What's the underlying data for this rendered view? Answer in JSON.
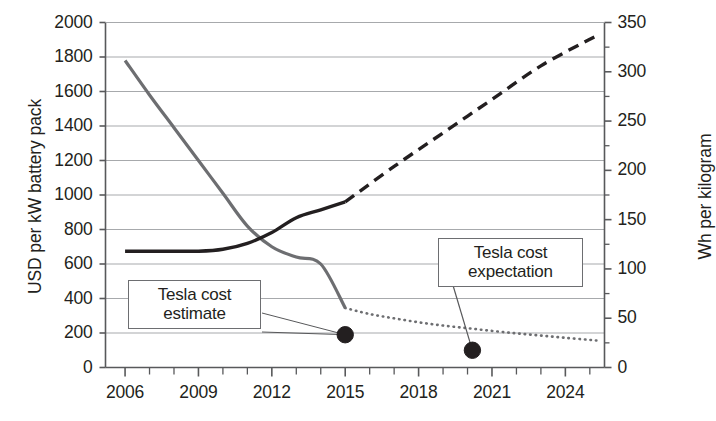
{
  "chart_data": {
    "type": "line",
    "title": "",
    "xlabel": "",
    "ylabel": "USD per kW battery pack",
    "y2label": "Wh per kilogram",
    "xlim": [
      2005.2,
      2025.6
    ],
    "ylim": [
      0,
      2000
    ],
    "y2lim": [
      0,
      350
    ],
    "grid": true,
    "legend": "none",
    "x_ticks_major": [
      2006,
      2009,
      2012,
      2015,
      2018,
      2021,
      2024
    ],
    "x_tick_labels": [
      "2006",
      "2009",
      "2012",
      "2015",
      "2018",
      "2021",
      "2024"
    ],
    "x_ticks_minor": [
      2007,
      2008,
      2010,
      2011,
      2013,
      2014,
      2016,
      2017,
      2019,
      2020,
      2022,
      2023,
      2025
    ],
    "y_ticks": [
      0,
      200,
      400,
      600,
      800,
      1000,
      1200,
      1400,
      1600,
      1800,
      2000
    ],
    "y_tick_labels": [
      "0",
      "200",
      "400",
      "600",
      "800",
      "1000",
      "1200",
      "1400",
      "1600",
      "1800",
      "2000"
    ],
    "y2_ticks": [
      0,
      50,
      100,
      150,
      200,
      250,
      300,
      350
    ],
    "y2_tick_labels": [
      "0",
      "50",
      "100",
      "150",
      "200",
      "250",
      "300",
      "350"
    ],
    "y2_ticks_minor": [
      25,
      75,
      125,
      175,
      225,
      275,
      325
    ],
    "series": [
      {
        "name": "USD per kW battery pack",
        "axis": "left",
        "color": "#6d6e71",
        "style": "solid",
        "width": 3.2,
        "x": [
          2006,
          2007,
          2008,
          2009,
          2010,
          2011,
          2012,
          2013,
          2014,
          2015
        ],
        "values": [
          1780,
          1580,
          1390,
          1200,
          1010,
          820,
          700,
          640,
          600,
          345
        ]
      },
      {
        "name": "USD per kW battery pack (projected)",
        "axis": "left",
        "color": "#6d6e71",
        "style": "dotted",
        "width": 3.0,
        "x": [
          2015,
          2016,
          2017,
          2018,
          2019,
          2020,
          2021,
          2022,
          2023,
          2024,
          2025,
          2025.4
        ],
        "values": [
          345,
          310,
          285,
          262,
          243,
          228,
          212,
          198,
          185,
          172,
          160,
          155
        ]
      },
      {
        "name": "Wh per kilogram",
        "axis": "right",
        "color": "#231f20",
        "style": "solid",
        "width": 3.4,
        "x": [
          2006,
          2007,
          2008,
          2009,
          2010,
          2011,
          2012,
          2013,
          2014,
          2015
        ],
        "values": [
          118,
          118,
          118,
          118,
          120,
          126,
          137,
          152,
          160,
          168
        ]
      },
      {
        "name": "Wh per kilogram (projected)",
        "axis": "right",
        "color": "#231f20",
        "style": "dashed",
        "width": 3.4,
        "x": [
          2015,
          2017,
          2019,
          2021,
          2023,
          2025,
          2025.3
        ],
        "values": [
          168,
          204,
          238,
          272,
          306,
          333,
          336
        ]
      }
    ],
    "points": [
      {
        "name": "Tesla cost estimate",
        "axis": "left",
        "x": 2015,
        "value": 190,
        "marker": "circle",
        "color": "#231f20"
      },
      {
        "name": "Tesla cost expectation",
        "axis": "left",
        "x": 2020.2,
        "value": 100,
        "marker": "circle",
        "color": "#231f20"
      }
    ],
    "annotations": [
      {
        "id": "estimate",
        "text": "Tesla cost estimate",
        "line1": "Tesla cost",
        "line2": "estimate"
      },
      {
        "id": "expectation",
        "text": "Tesla cost expectation",
        "line1": "Tesla cost",
        "line2": "expectation"
      }
    ]
  },
  "axes": {
    "left_title": "USD per kW battery pack",
    "right_title": "Wh per kilogram"
  },
  "callouts": {
    "estimate": {
      "line1": "Tesla cost",
      "line2": "estimate"
    },
    "expectation": {
      "line1": "Tesla cost",
      "line2": "expectation"
    }
  },
  "colors": {
    "cost_line": "#6d6e71",
    "energy_line": "#231f20",
    "grid": "#a7a9ac",
    "axis": "#58595b",
    "text": "#231f20",
    "background": "#ffffff"
  }
}
